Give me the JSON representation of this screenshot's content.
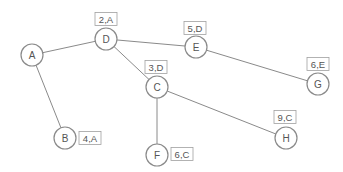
{
  "diagram": {
    "type": "tree-graph",
    "nodes": [
      {
        "id": "A",
        "label": "A",
        "x": 32,
        "y": 55,
        "tag": ""
      },
      {
        "id": "D",
        "label": "D",
        "x": 106,
        "y": 39,
        "tag": "2,A",
        "tag_x": 106,
        "tag_y": 19
      },
      {
        "id": "E",
        "label": "E",
        "x": 196,
        "y": 47,
        "tag": "5,D",
        "tag_x": 195,
        "tag_y": 28
      },
      {
        "id": "C",
        "label": "C",
        "x": 157,
        "y": 87,
        "tag": "3,D",
        "tag_x": 156,
        "tag_y": 67
      },
      {
        "id": "G",
        "label": "G",
        "x": 318,
        "y": 84,
        "tag": "6,E",
        "tag_x": 318,
        "tag_y": 64
      },
      {
        "id": "B",
        "label": "B",
        "x": 65,
        "y": 138,
        "tag": "4,A",
        "tag_x": 90,
        "tag_y": 138
      },
      {
        "id": "H",
        "label": "H",
        "x": 286,
        "y": 138,
        "tag": "9,C",
        "tag_x": 285,
        "tag_y": 117
      },
      {
        "id": "F",
        "label": "F",
        "x": 157,
        "y": 155,
        "tag": "6,C",
        "tag_x": 182,
        "tag_y": 154
      }
    ],
    "edges": [
      {
        "from": "A",
        "to": "D"
      },
      {
        "from": "A",
        "to": "B"
      },
      {
        "from": "D",
        "to": "E"
      },
      {
        "from": "D",
        "to": "C"
      },
      {
        "from": "E",
        "to": "G"
      },
      {
        "from": "C",
        "to": "F"
      },
      {
        "from": "C",
        "to": "H"
      }
    ]
  },
  "colors": {
    "edge": "#8a8a8a",
    "node_stroke": "#8a8a8a",
    "text": "#555555",
    "tag_border": "#a0a0a0"
  }
}
